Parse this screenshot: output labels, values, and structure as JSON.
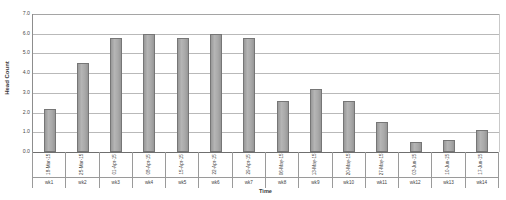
{
  "chart_data": {
    "type": "bar",
    "title": "",
    "subtitle": "",
    "xlabel": "Time",
    "ylabel": "Head Count",
    "categories": [
      "wk1",
      "wk2",
      "wk3",
      "wk4",
      "wk5",
      "wk6",
      "wk7",
      "wk8",
      "wk9",
      "wk10",
      "wk11",
      "wk12",
      "wk13",
      "wk14"
    ],
    "category_dates": [
      "18-Mar-15",
      "25-Mar-15",
      "01-Apr-15",
      "08-Apr-15",
      "15-Apr-15",
      "22-Apr-15",
      "29-Apr-15",
      "06-May-15",
      "13-May-15",
      "20-May-15",
      "27-May-15",
      "03-Jun-15",
      "10-Jun-15",
      "17-Jun-15"
    ],
    "values": [
      2.2,
      4.5,
      5.8,
      6.0,
      5.8,
      6.0,
      5.8,
      2.6,
      3.2,
      2.6,
      1.5,
      0.5,
      0.6,
      1.1
    ],
    "ylim": [
      0.0,
      7.0
    ],
    "ytick_labels": [
      "7.0",
      "6.0",
      "5.0",
      "4.0",
      "3.0",
      "2.0",
      "1.0",
      "0.0"
    ],
    "ytick_values": [
      7.0,
      6.0,
      5.0,
      4.0,
      3.0,
      2.0,
      1.0,
      0.0
    ],
    "grid": true,
    "legend": false,
    "legend_position": "none",
    "bar_color": "#a9a9a9",
    "bar_border_color": "#767676",
    "gridline_color": "#b9b9b9",
    "axis_color": "#8d8d8d",
    "background_color": "#ffffff"
  }
}
